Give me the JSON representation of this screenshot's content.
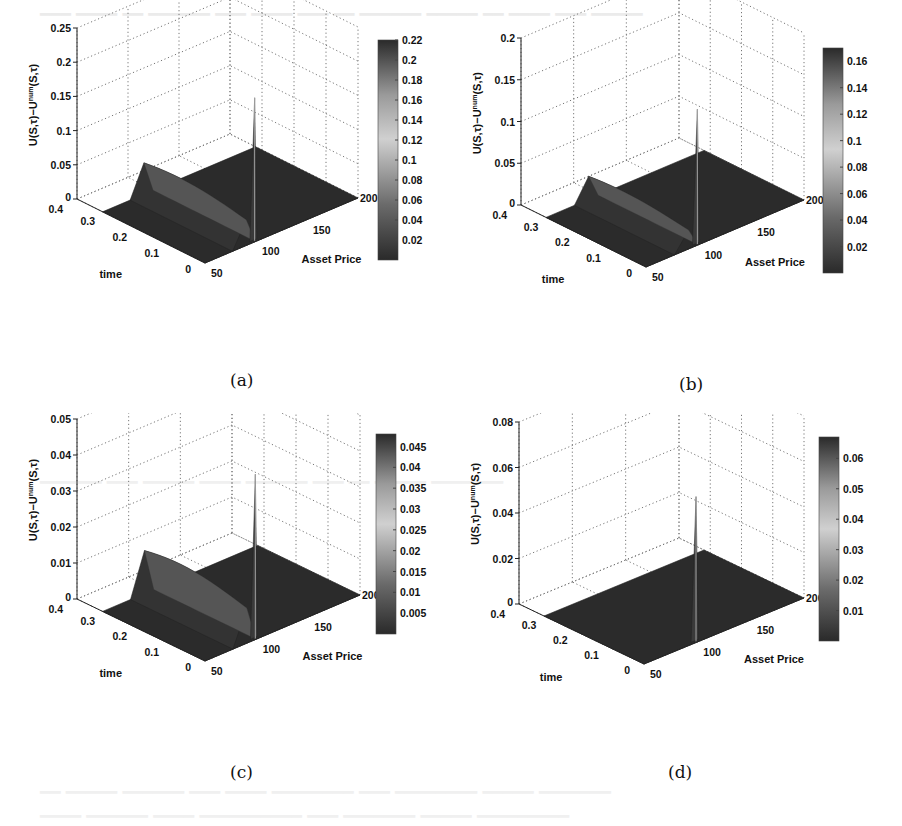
{
  "figure": {
    "captions": [
      "(a)",
      "(b)",
      "(c)",
      "(d)"
    ]
  },
  "chart_data": [
    {
      "type": "surface3d",
      "panel": "(a)",
      "zlabel": "U(S,τ)−U^num(S,τ)",
      "xlabel": "Asset Price",
      "ylabel": "time",
      "x_ticks": [
        "50",
        "100",
        "150",
        "200"
      ],
      "y_ticks": [
        "0",
        "0.1",
        "0.2",
        "0.3",
        "0.4"
      ],
      "z_ticks": [
        "0",
        "0.05",
        "0.1",
        "0.15",
        "0.2",
        "0.25"
      ],
      "zlim": [
        0,
        0.25
      ],
      "colorbar_ticks": [
        "0.02",
        "0.04",
        "0.06",
        "0.08",
        "0.1",
        "0.12",
        "0.14",
        "0.16",
        "0.18",
        "0.2",
        "0.22"
      ],
      "peak_value": 0.22,
      "peak_location": {
        "asset_price": 100,
        "time": 0
      },
      "ridge_height": 0.05
    },
    {
      "type": "surface3d",
      "panel": "(b)",
      "zlabel": "U(S,τ)−U^num(S,τ)",
      "xlabel": "Asset Price",
      "ylabel": "time",
      "x_ticks": [
        "50",
        "100",
        "150",
        "200"
      ],
      "y_ticks": [
        "0",
        "0.1",
        "0.2",
        "0.3",
        "0.4"
      ],
      "z_ticks": [
        "0",
        "0.05",
        "0.1",
        "0.15",
        "0.2"
      ],
      "zlim": [
        0,
        0.2
      ],
      "colorbar_ticks": [
        "0.02",
        "0.04",
        "0.06",
        "0.08",
        "0.1",
        "0.12",
        "0.14",
        "0.16"
      ],
      "peak_value": 0.17,
      "peak_location": {
        "asset_price": 100,
        "time": 0
      },
      "ridge_height": 0.03
    },
    {
      "type": "surface3d",
      "panel": "(c)",
      "zlabel": "U(S,τ)−U^num(S,τ)",
      "xlabel": "Asset Price",
      "ylabel": "time",
      "x_ticks": [
        "50",
        "100",
        "150",
        "200"
      ],
      "y_ticks": [
        "0",
        "0.1",
        "0.2",
        "0.3",
        "0.4"
      ],
      "z_ticks": [
        "0",
        "0.01",
        "0.02",
        "0.03",
        "0.04",
        "0.05"
      ],
      "zlim": [
        0,
        0.05
      ],
      "colorbar_ticks": [
        "0.005",
        "0.01",
        "0.015",
        "0.02",
        "0.025",
        "0.03",
        "0.035",
        "0.04",
        "0.045"
      ],
      "peak_value": 0.048,
      "peak_location": {
        "asset_price": 100,
        "time": 0
      },
      "ridge_height": 0.013
    },
    {
      "type": "surface3d",
      "panel": "(d)",
      "zlabel": "U(S,τ)−U^num(S,τ)",
      "xlabel": "Asset Price",
      "ylabel": "time",
      "x_ticks": [
        "50",
        "100",
        "150",
        "200"
      ],
      "y_ticks": [
        "0",
        "0.1",
        "0.2",
        "0.3",
        "0.4"
      ],
      "z_ticks": [
        "0",
        "0.02",
        "0.04",
        "0.06",
        "0.08"
      ],
      "zlim": [
        0,
        0.08
      ],
      "colorbar_ticks": [
        "0.01",
        "0.02",
        "0.03",
        "0.04",
        "0.05",
        "0.06"
      ],
      "peak_value": 0.067,
      "peak_location": {
        "asset_price": 100,
        "time": 0
      },
      "ridge_height": 0.0
    }
  ]
}
